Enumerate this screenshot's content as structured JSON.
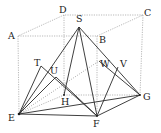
{
  "diagram": {
    "points": {
      "A": {
        "label": "A",
        "x": 18,
        "y": 36,
        "lx": 8,
        "ly": 39
      },
      "B": {
        "label": "B",
        "x": 97,
        "y": 36,
        "lx": 99,
        "ly": 43
      },
      "C": {
        "label": "C",
        "x": 143,
        "y": 15,
        "lx": 144,
        "ly": 16
      },
      "D": {
        "label": "D",
        "x": 64,
        "y": 15,
        "lx": 59,
        "ly": 13
      },
      "E": {
        "label": "E",
        "x": 19,
        "y": 114,
        "lx": 8,
        "ly": 121
      },
      "F": {
        "label": "F",
        "x": 97,
        "y": 116,
        "lx": 93,
        "ly": 127
      },
      "G": {
        "label": "G",
        "x": 140,
        "y": 95,
        "lx": 143,
        "ly": 100
      },
      "H": {
        "label": "H",
        "x": 64,
        "y": 95,
        "lx": 61,
        "ly": 105
      },
      "S": {
        "label": "S",
        "x": 79,
        "y": 27,
        "lx": 76,
        "ly": 22
      },
      "T": {
        "label": "T",
        "x": 41,
        "y": 66,
        "lx": 34,
        "ly": 66
      },
      "U": {
        "label": "U",
        "x": 56,
        "y": 77,
        "lx": 50,
        "ly": 74
      },
      "W": {
        "label": "W",
        "x": 99,
        "y": 61,
        "lx": 100,
        "ly": 67
      },
      "V": {
        "label": "V",
        "x": 118,
        "y": 67,
        "lx": 120,
        "ly": 67
      }
    },
    "labels": [
      "A",
      "B",
      "C",
      "D",
      "E",
      "F",
      "G",
      "H",
      "S",
      "T",
      "U",
      "V",
      "W"
    ],
    "solid_edges": [
      [
        "E",
        "F"
      ],
      [
        "F",
        "G"
      ],
      [
        "S",
        "E"
      ],
      [
        "S",
        "F"
      ],
      [
        "S",
        "G"
      ],
      [
        "S",
        "H"
      ],
      [
        "T",
        "F"
      ],
      [
        "U",
        "E"
      ],
      [
        "U",
        "F"
      ],
      [
        "V",
        "F"
      ],
      [
        "W",
        "G"
      ],
      [
        "E",
        "G"
      ],
      [
        "T",
        "E"
      ]
    ],
    "hidden_edges": [
      [
        "A",
        "B"
      ],
      [
        "B",
        "C"
      ],
      [
        "C",
        "D"
      ],
      [
        "D",
        "A"
      ],
      [
        "A",
        "E"
      ],
      [
        "B",
        "F"
      ],
      [
        "C",
        "G"
      ],
      [
        "D",
        "H"
      ],
      [
        "E",
        "H"
      ],
      [
        "H",
        "G"
      ],
      [
        "E",
        "W"
      ]
    ],
    "colors": {
      "line": "#2a2a2a",
      "hidden": "#8a8a8a",
      "background": "#ffffff"
    }
  }
}
